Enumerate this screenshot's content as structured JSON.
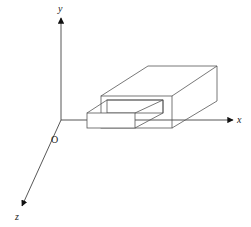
{
  "diagram": {
    "title": "",
    "axes": {
      "y": {
        "label": "y"
      },
      "x": {
        "label": "x"
      },
      "z": {
        "label": "z"
      },
      "origin": {
        "label": "O"
      }
    },
    "objects": [
      {
        "name": "outer-box",
        "description": "rectangular prism with an opening on its front face"
      },
      {
        "name": "inner-box",
        "description": "smaller rectangular prism protruding from the opening"
      }
    ],
    "colors": {
      "line": "#333333",
      "background": "#ffffff"
    }
  }
}
